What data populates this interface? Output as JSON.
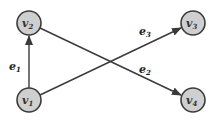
{
  "diagram": {
    "type": "directed-graph",
    "colors": {
      "node_fill": "#cfcfcf",
      "node_stroke": "#3a3a3a",
      "edge": "#3a3a3a"
    },
    "nodes": [
      {
        "id": "v1",
        "base": "v",
        "sub": "1",
        "x": 29,
        "y": 100
      },
      {
        "id": "v2",
        "base": "v",
        "sub": "2",
        "x": 29,
        "y": 23
      },
      {
        "id": "v3",
        "base": "v",
        "sub": "3",
        "x": 193,
        "y": 23
      },
      {
        "id": "v4",
        "base": "v",
        "sub": "4",
        "x": 193,
        "y": 100
      }
    ],
    "edges": [
      {
        "id": "e1",
        "from": "v1",
        "to": "v2",
        "base": "e",
        "sub": "1"
      },
      {
        "id": "e2",
        "from": "v2",
        "to": "v4",
        "base": "e",
        "sub": "2"
      },
      {
        "id": "e3",
        "from": "v1",
        "to": "v3",
        "base": "e",
        "sub": "3"
      }
    ]
  }
}
